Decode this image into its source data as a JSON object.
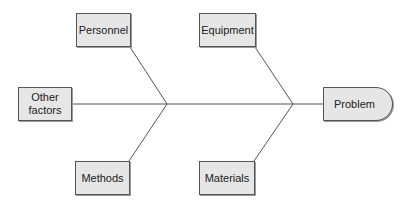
{
  "diagram": {
    "type": "fishbone (cause-and-effect)",
    "effect": {
      "label": "Problem"
    },
    "causes": [
      {
        "id": "personnel",
        "label": "Personnel",
        "position": "top-left"
      },
      {
        "id": "equipment",
        "label": "Equipment",
        "position": "top-right"
      },
      {
        "id": "other",
        "label": "Other\nfactors",
        "position": "left"
      },
      {
        "id": "methods",
        "label": "Methods",
        "position": "bottom-left"
      },
      {
        "id": "materials",
        "label": "Materials",
        "position": "bottom-right"
      }
    ],
    "colors": {
      "box_fill": "#e6e6e6",
      "box_border": "#555555",
      "line": "#555555",
      "text": "#222222",
      "background": "#ffffff"
    }
  }
}
